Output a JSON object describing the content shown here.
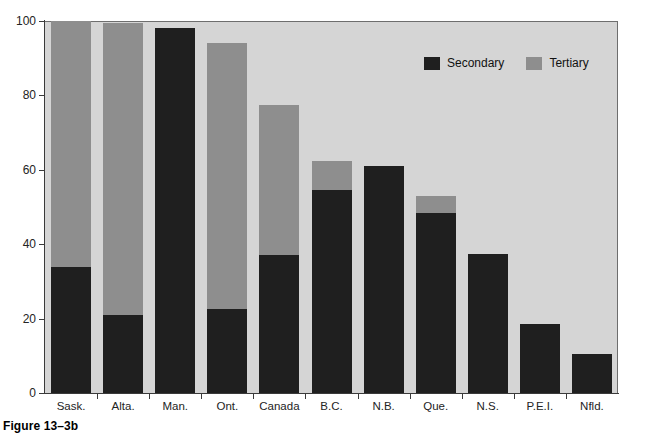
{
  "caption": "Figure 13–3b",
  "legend": {
    "position": "top-right-inside",
    "items": [
      {
        "label": "Secondary",
        "color": "#1f1f1f",
        "swatch": "secondary-swatch"
      },
      {
        "label": "Tertiary",
        "color": "#8e8e8e",
        "swatch": "tertiary-swatch"
      }
    ]
  },
  "colors": {
    "secondary": "#1f1f1f",
    "tertiary": "#8e8e8e",
    "plot_background": "#d5d5d5",
    "page_background": "#ffffff",
    "axis": "#3a3a3a",
    "text": "#242424"
  },
  "chart_data": {
    "type": "bar",
    "subtype": "stacked-vertical",
    "title": "",
    "subtitle": "",
    "xlabel": "",
    "ylabel": "",
    "ylim": [
      0,
      100
    ],
    "yticks": [
      0,
      20,
      40,
      60,
      80,
      100
    ],
    "ytick_labels": [
      "0",
      "20",
      "40",
      "60",
      "80",
      "100"
    ],
    "grid": false,
    "legend_position": "inside top right",
    "categories": [
      "Sask.",
      "Alta.",
      "Man.",
      "Ont.",
      "Canada",
      "B.C.",
      "N.B.",
      "Que.",
      "N.S.",
      "P.E.I.",
      "Nfld."
    ],
    "series": [
      {
        "name": "Secondary",
        "color": "#1f1f1f",
        "values": [
          34,
          21,
          98,
          22.5,
          37,
          54.5,
          61,
          48.5,
          37.5,
          18.5,
          10.5
        ]
      },
      {
        "name": "Tertiary",
        "color": "#8e8e8e",
        "values": [
          66,
          78.5,
          0,
          71.5,
          40.5,
          8,
          0,
          4.5,
          0,
          0,
          0
        ]
      }
    ],
    "totals": [
      100,
      99.5,
      98,
      94,
      77.5,
      62.5,
      61,
      53,
      37.5,
      18.5,
      10.5
    ],
    "annotations": []
  }
}
